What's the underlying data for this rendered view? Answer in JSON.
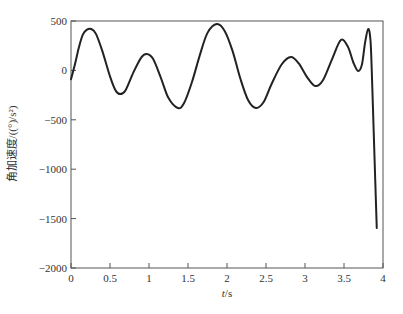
{
  "chart_data": {
    "type": "line",
    "title": "",
    "xlabel": "t/s",
    "ylabel": "角加速度/((°)/s²)",
    "xlim": [
      0,
      4
    ],
    "ylim": [
      -2000,
      500
    ],
    "xticks": [
      0,
      0.5,
      1,
      1.5,
      2,
      2.5,
      3,
      3.5,
      4
    ],
    "xtick_labels": [
      "0",
      "0.5",
      "1",
      "1.5",
      "2",
      "2.5",
      "3",
      "3.5",
      "4"
    ],
    "yticks": [
      -2000,
      -1500,
      -1000,
      -500,
      0,
      500
    ],
    "ytick_labels": [
      "−2000",
      "−1500",
      "−1000",
      "−500",
      "0",
      "500"
    ],
    "grid": false,
    "legend": null,
    "line_color": "#222222",
    "series": [
      {
        "name": "angular acceleration",
        "x": [
          0.0,
          0.05,
          0.1,
          0.15,
          0.2,
          0.26,
          0.32,
          0.4,
          0.5,
          0.57,
          0.63,
          0.7,
          0.8,
          0.9,
          0.97,
          1.05,
          1.15,
          1.25,
          1.37,
          1.45,
          1.55,
          1.65,
          1.75,
          1.87,
          1.97,
          2.07,
          2.17,
          2.27,
          2.37,
          2.47,
          2.57,
          2.7,
          2.82,
          2.92,
          3.02,
          3.13,
          3.23,
          3.35,
          3.46,
          3.55,
          3.62,
          3.68,
          3.73,
          3.77,
          3.81,
          3.84,
          3.86,
          3.88,
          3.9,
          3.92
        ],
        "y": [
          -90,
          60,
          230,
          360,
          410,
          419,
          370,
          200,
          -60,
          -200,
          -240,
          -200,
          -20,
          130,
          166,
          120,
          -70,
          -280,
          -380,
          -330,
          -120,
          150,
          380,
          470,
          400,
          200,
          -80,
          -300,
          -380,
          -320,
          -140,
          60,
          136,
          70,
          -60,
          -158,
          -100,
          120,
          308,
          240,
          80,
          -6,
          60,
          280,
          419,
          300,
          -100,
          -600,
          -1100,
          -1595
        ]
      }
    ]
  }
}
